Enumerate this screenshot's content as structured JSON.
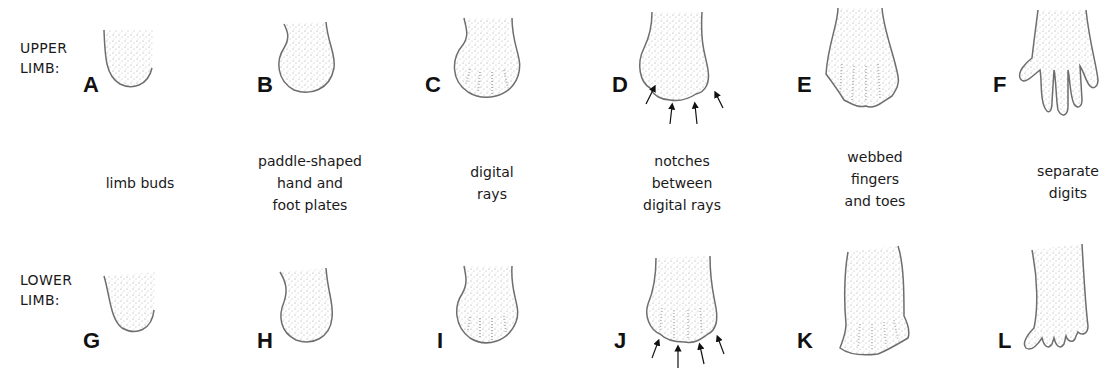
{
  "rows": {
    "upper": "UPPER\nLIMB:",
    "lower": "LOWER\nLIMB:"
  },
  "stages": [
    {
      "upper": "A",
      "lower": "G",
      "caption": "limb buds"
    },
    {
      "upper": "B",
      "lower": "H",
      "caption": "paddle-shaped\nhand and\nfoot plates"
    },
    {
      "upper": "C",
      "lower": "I",
      "caption": "digital\nrays"
    },
    {
      "upper": "D",
      "lower": "J",
      "caption": "notches\nbetween\ndigital rays"
    },
    {
      "upper": "E",
      "lower": "K",
      "caption": "webbed\nfingers\nand toes"
    },
    {
      "upper": "F",
      "lower": "L",
      "caption": "separate\ndigits"
    }
  ],
  "colors": {
    "outline": "#6e6e6e",
    "stipple": "#9a9a9a",
    "text": "#1a1a1a"
  }
}
